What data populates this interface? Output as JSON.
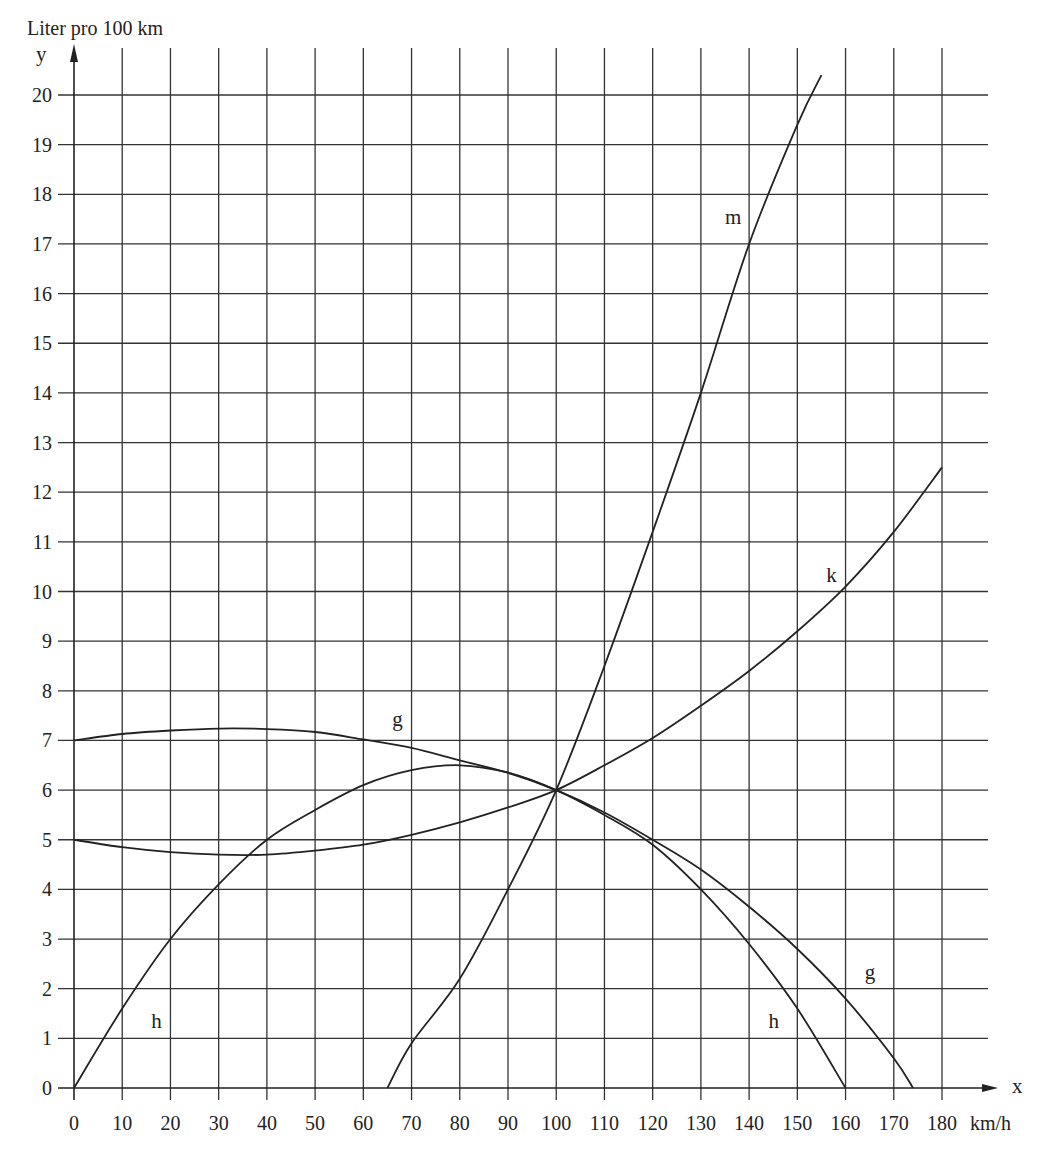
{
  "chart_data": {
    "type": "line",
    "title": "",
    "ylabel_top": "Liter pro 100 km",
    "yaxis_symbol": "y",
    "xaxis_symbol": "x",
    "xunit": "km/h",
    "xlim": [
      0,
      180
    ],
    "ylim": [
      0,
      20
    ],
    "xticks": [
      0,
      10,
      20,
      30,
      40,
      50,
      60,
      70,
      80,
      90,
      100,
      110,
      120,
      130,
      140,
      150,
      160,
      170,
      180
    ],
    "yticks": [
      0,
      1,
      2,
      3,
      4,
      5,
      6,
      7,
      8,
      9,
      10,
      11,
      12,
      13,
      14,
      15,
      16,
      17,
      18,
      19,
      20
    ],
    "grid": true,
    "series": [
      {
        "name": "m",
        "label_pos": [
          135,
          17.4
        ],
        "points": [
          [
            65,
            0
          ],
          [
            70,
            0.9
          ],
          [
            80,
            2.2
          ],
          [
            90,
            4.0
          ],
          [
            100,
            6.0
          ],
          [
            110,
            8.5
          ],
          [
            120,
            11.2
          ],
          [
            130,
            14.0
          ],
          [
            140,
            17.0
          ],
          [
            150,
            19.4
          ],
          [
            155,
            20.4
          ]
        ]
      },
      {
        "name": "k",
        "label_pos": [
          156,
          10.2
        ],
        "points": [
          [
            0,
            5.0
          ],
          [
            10,
            4.85
          ],
          [
            20,
            4.75
          ],
          [
            30,
            4.7
          ],
          [
            40,
            4.7
          ],
          [
            50,
            4.78
          ],
          [
            60,
            4.9
          ],
          [
            70,
            5.1
          ],
          [
            80,
            5.35
          ],
          [
            90,
            5.65
          ],
          [
            100,
            6.0
          ],
          [
            110,
            6.5
          ],
          [
            120,
            7.05
          ],
          [
            130,
            7.7
          ],
          [
            140,
            8.4
          ],
          [
            150,
            9.2
          ],
          [
            160,
            10.1
          ],
          [
            170,
            11.2
          ],
          [
            180,
            12.5
          ]
        ]
      },
      {
        "name": "g",
        "label_pos": [
          66,
          7.3
        ],
        "label_pos2": [
          164,
          2.2
        ],
        "points": [
          [
            0,
            7.0
          ],
          [
            10,
            7.13
          ],
          [
            20,
            7.2
          ],
          [
            30,
            7.24
          ],
          [
            40,
            7.23
          ],
          [
            50,
            7.17
          ],
          [
            60,
            7.02
          ],
          [
            70,
            6.85
          ],
          [
            80,
            6.6
          ],
          [
            90,
            6.35
          ],
          [
            100,
            6.0
          ],
          [
            110,
            5.55
          ],
          [
            120,
            5.0
          ],
          [
            130,
            4.4
          ],
          [
            140,
            3.65
          ],
          [
            150,
            2.8
          ],
          [
            160,
            1.8
          ],
          [
            170,
            0.6
          ],
          [
            174,
            0
          ]
        ]
      },
      {
        "name": "h",
        "label_pos": [
          16,
          1.2
        ],
        "label_pos2": [
          144,
          1.2
        ],
        "points": [
          [
            0,
            0
          ],
          [
            10,
            1.6
          ],
          [
            20,
            3.0
          ],
          [
            30,
            4.1
          ],
          [
            40,
            5.0
          ],
          [
            50,
            5.6
          ],
          [
            60,
            6.1
          ],
          [
            70,
            6.4
          ],
          [
            80,
            6.5
          ],
          [
            90,
            6.35
          ],
          [
            100,
            6.0
          ],
          [
            110,
            5.5
          ],
          [
            120,
            4.9
          ],
          [
            130,
            4.0
          ],
          [
            140,
            2.9
          ],
          [
            150,
            1.6
          ],
          [
            160,
            0
          ]
        ]
      }
    ],
    "colors": {
      "line": "#222222",
      "grid": "#333333",
      "background": "#ffffff"
    }
  }
}
